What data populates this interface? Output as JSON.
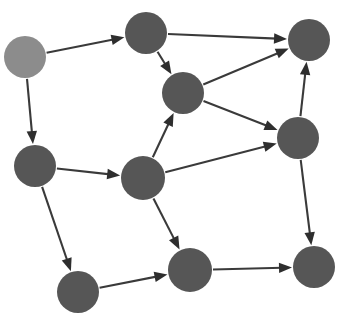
{
  "figure": {
    "kind": "directed-graph-diagram",
    "width": 342,
    "height": 323,
    "background_color": "#ffffff",
    "node_count": 9,
    "edge_count": 15,
    "node_default_color": "#565656",
    "node_highlight_color": "#8c8c8c",
    "edge_color": "#3a3a3a",
    "arrowhead_color": "#2e2e2e"
  },
  "nodes": [
    {
      "id": "n1",
      "label": "",
      "cx": 25,
      "cy": 57,
      "r": 21,
      "color": "#8c8c8c",
      "role": "source"
    },
    {
      "id": "n2",
      "label": "",
      "cx": 146,
      "cy": 33,
      "r": 21,
      "color": "#565656",
      "role": "normal"
    },
    {
      "id": "n3",
      "label": "",
      "cx": 309,
      "cy": 40,
      "r": 21,
      "color": "#565656",
      "role": "normal"
    },
    {
      "id": "n4",
      "label": "",
      "cx": 183,
      "cy": 93,
      "r": 21,
      "color": "#565656",
      "role": "normal"
    },
    {
      "id": "n5",
      "label": "",
      "cx": 35,
      "cy": 166,
      "r": 21,
      "color": "#565656",
      "role": "normal"
    },
    {
      "id": "n6",
      "label": "",
      "cx": 143,
      "cy": 178,
      "r": 22,
      "color": "#565656",
      "role": "normal"
    },
    {
      "id": "n7",
      "label": "",
      "cx": 298,
      "cy": 138,
      "r": 21,
      "color": "#565656",
      "role": "normal"
    },
    {
      "id": "n8",
      "label": "",
      "cx": 78,
      "cy": 292,
      "r": 21,
      "color": "#565656",
      "role": "normal"
    },
    {
      "id": "n9",
      "label": "",
      "cx": 190,
      "cy": 270,
      "r": 22,
      "color": "#565656",
      "role": "normal"
    },
    {
      "id": "n10",
      "label": "",
      "cx": 314,
      "cy": 267,
      "r": 21,
      "color": "#565656",
      "role": "normal"
    }
  ],
  "edges": [
    {
      "id": "e1",
      "from": "n1",
      "to": "n2",
      "directed": true
    },
    {
      "id": "e2",
      "from": "n1",
      "to": "n5",
      "directed": true
    },
    {
      "id": "e3",
      "from": "n2",
      "to": "n3",
      "directed": true
    },
    {
      "id": "e4",
      "from": "n2",
      "to": "n4",
      "directed": true
    },
    {
      "id": "e5",
      "from": "n4",
      "to": "n3",
      "directed": true
    },
    {
      "id": "e6",
      "from": "n4",
      "to": "n7",
      "directed": true
    },
    {
      "id": "e7",
      "from": "n5",
      "to": "n6",
      "directed": true
    },
    {
      "id": "e8",
      "from": "n5",
      "to": "n8",
      "directed": true
    },
    {
      "id": "e9",
      "from": "n6",
      "to": "n4",
      "directed": true
    },
    {
      "id": "e10",
      "from": "n6",
      "to": "n7",
      "directed": true
    },
    {
      "id": "e11",
      "from": "n6",
      "to": "n9",
      "directed": true
    },
    {
      "id": "e12",
      "from": "n7",
      "to": "n3",
      "directed": true
    },
    {
      "id": "e13",
      "from": "n7",
      "to": "n10",
      "directed": true
    },
    {
      "id": "e14",
      "from": "n8",
      "to": "n9",
      "directed": true
    },
    {
      "id": "e15",
      "from": "n9",
      "to": "n10",
      "directed": true
    }
  ]
}
